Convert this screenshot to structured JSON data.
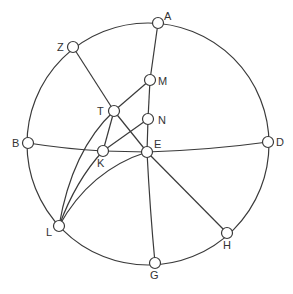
{
  "diagram": {
    "title": "",
    "circle": {
      "cx": 148,
      "cy": 144,
      "r": 121
    },
    "node_radius": 5.5,
    "nodes": [
      {
        "id": "A",
        "label": "A",
        "x": 158,
        "y": 23,
        "lx": 164,
        "ly": 20
      },
      {
        "id": "Z",
        "label": "Z",
        "x": 73,
        "y": 47,
        "lx": 57,
        "ly": 51
      },
      {
        "id": "M",
        "label": "M",
        "x": 150,
        "y": 80,
        "lx": 158,
        "ly": 85
      },
      {
        "id": "T",
        "label": "T",
        "x": 114,
        "y": 111,
        "lx": 97,
        "ly": 115
      },
      {
        "id": "N",
        "label": "N",
        "x": 148,
        "y": 119,
        "lx": 158,
        "ly": 124
      },
      {
        "id": "B",
        "label": "B",
        "x": 28,
        "y": 143,
        "lx": 12,
        "ly": 147
      },
      {
        "id": "K",
        "label": "K",
        "x": 103,
        "y": 151,
        "lx": 97,
        "ly": 167
      },
      {
        "id": "E",
        "label": "E",
        "x": 147,
        "y": 152,
        "lx": 154,
        "ly": 148
      },
      {
        "id": "D",
        "label": "D",
        "x": 268,
        "y": 142,
        "lx": 276,
        "ly": 146
      },
      {
        "id": "L",
        "label": "L",
        "x": 59,
        "y": 226,
        "lx": 46,
        "ly": 236
      },
      {
        "id": "H",
        "label": "H",
        "x": 227,
        "y": 233,
        "lx": 223,
        "ly": 249
      },
      {
        "id": "G",
        "label": "G",
        "x": 155,
        "y": 263,
        "lx": 150,
        "ly": 279
      }
    ],
    "edges": [
      {
        "from": "A",
        "to": "M",
        "d": "M158,23 L150,80"
      },
      {
        "from": "M",
        "to": "N",
        "d": "M150,80 L148,119"
      },
      {
        "from": "N",
        "to": "E",
        "d": "M148,119 L147,152"
      },
      {
        "from": "E",
        "to": "G",
        "d": "M147,152 Q150,210 155,263"
      },
      {
        "from": "Z",
        "to": "T",
        "d": "M73,47 L114,111"
      },
      {
        "from": "T",
        "to": "E",
        "d": "M114,111 L147,152"
      },
      {
        "from": "E",
        "to": "H",
        "d": "M147,152 L227,233"
      },
      {
        "from": "M",
        "to": "T",
        "d": "M150,80 L114,111"
      },
      {
        "from": "B",
        "to": "K",
        "d": "M28,143 Q66,149 103,151"
      },
      {
        "from": "K",
        "to": "E",
        "d": "M103,151 L147,152"
      },
      {
        "from": "E",
        "to": "D",
        "d": "M147,152 Q210,150 268,142"
      },
      {
        "from": "K",
        "to": "N",
        "d": "M103,151 L148,119"
      },
      {
        "from": "K",
        "to": "T",
        "d": "M103,151 L114,111"
      },
      {
        "from": "L",
        "to": "T",
        "d": "M59,226 Q72,150 114,111"
      },
      {
        "from": "L",
        "to": "K",
        "d": "M59,226 Q76,180 103,151"
      },
      {
        "from": "L",
        "to": "E",
        "d": "M59,226 Q90,170 147,152"
      }
    ]
  }
}
